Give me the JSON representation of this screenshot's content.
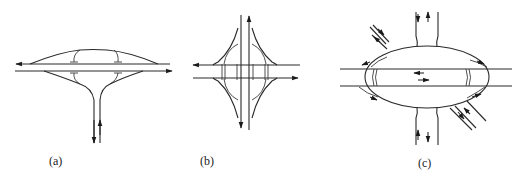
{
  "figure": {
    "panels": [
      {
        "id": "a",
        "label": "(a)",
        "description": "T-interchange with looping ramps above and below a two-way horizontal road"
      },
      {
        "id": "b",
        "label": "(b)",
        "description": "Diamond-style interchange with curved ramps connecting vertical and horizontal roads"
      },
      {
        "id": "c",
        "label": "(c)",
        "description": "Elliptical roundabout interchange with radial approach roads"
      }
    ],
    "colors": {
      "line": "#2a2a2a",
      "background": "#ffffff"
    }
  }
}
